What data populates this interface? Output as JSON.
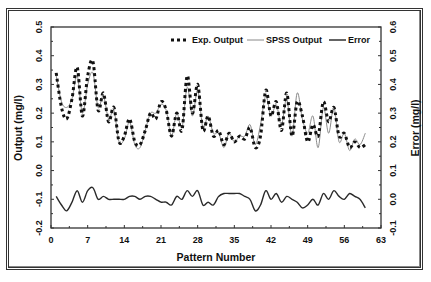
{
  "chart_data": {
    "type": "line",
    "title": "",
    "xlabel": "Pattern Number",
    "ylabel": "Output (mg/l)",
    "y2label": "Error (mg/l)",
    "xlim": [
      0,
      63
    ],
    "ylim": [
      -0.2,
      0.5
    ],
    "y2lim": [
      -0.1,
      0.6
    ],
    "x_ticks": [
      "0",
      "7",
      "14",
      "21",
      "28",
      "35",
      "42",
      "49",
      "56",
      "63"
    ],
    "y_ticks": [
      "-0.2",
      "-0.1",
      "0.0",
      "0.1",
      "0.2",
      "0.3",
      "0.4",
      "0.5"
    ],
    "y2_ticks": [
      "-0.1",
      "0.0",
      "0.1",
      "0.2",
      "0.3",
      "0.4",
      "0.5",
      "0.6"
    ],
    "grid": false,
    "legend_position": "top-right inside",
    "x": [
      1,
      2,
      3,
      4,
      5,
      6,
      7,
      8,
      9,
      10,
      11,
      12,
      13,
      14,
      15,
      16,
      17,
      18,
      19,
      20,
      21,
      22,
      23,
      24,
      25,
      26,
      27,
      28,
      29,
      30,
      31,
      32,
      33,
      34,
      35,
      36,
      37,
      38,
      39,
      40,
      41,
      42,
      43,
      44,
      45,
      46,
      47,
      48,
      49,
      50,
      51,
      52,
      53,
      54,
      55,
      56,
      57,
      58,
      59,
      60
    ],
    "series": [
      {
        "name": "Exp. Output",
        "style": "dashed-thick",
        "axis": "left",
        "values": [
          0.34,
          0.22,
          0.18,
          0.25,
          0.36,
          0.19,
          0.33,
          0.38,
          0.21,
          0.27,
          0.17,
          0.22,
          0.1,
          0.12,
          0.18,
          0.1,
          0.09,
          0.14,
          0.2,
          0.18,
          0.24,
          0.21,
          0.12,
          0.2,
          0.14,
          0.33,
          0.2,
          0.3,
          0.14,
          0.19,
          0.12,
          0.14,
          0.09,
          0.13,
          0.1,
          0.12,
          0.11,
          0.15,
          0.08,
          0.12,
          0.28,
          0.19,
          0.24,
          0.14,
          0.27,
          0.12,
          0.24,
          0.19,
          0.1,
          0.16,
          0.12,
          0.24,
          0.17,
          0.22,
          0.12,
          0.13,
          0.08,
          0.1,
          0.08,
          0.09
        ]
      },
      {
        "name": "SPSS Output",
        "style": "thin-gray",
        "axis": "left",
        "values": [
          0.33,
          0.24,
          0.22,
          0.25,
          0.33,
          0.2,
          0.3,
          0.34,
          0.22,
          0.26,
          0.18,
          0.21,
          0.1,
          0.11,
          0.17,
          0.09,
          0.08,
          0.14,
          0.2,
          0.2,
          0.23,
          0.21,
          0.12,
          0.2,
          0.15,
          0.29,
          0.19,
          0.28,
          0.15,
          0.19,
          0.13,
          0.13,
          0.08,
          0.13,
          0.1,
          0.12,
          0.12,
          0.16,
          0.09,
          0.16,
          0.26,
          0.19,
          0.23,
          0.16,
          0.25,
          0.12,
          0.27,
          0.18,
          0.13,
          0.19,
          0.08,
          0.22,
          0.13,
          0.22,
          0.1,
          0.13,
          0.07,
          0.11,
          0.09,
          0.13
        ]
      },
      {
        "name": "Error",
        "style": "solid-dark",
        "axis": "right",
        "values": [
          0.01,
          -0.02,
          -0.04,
          -0.01,
          0.03,
          -0.01,
          0.03,
          0.04,
          0.0,
          0.01,
          0.0,
          0.0,
          0.0,
          0.0,
          0.01,
          0.01,
          0.0,
          0.01,
          0.01,
          0.0,
          -0.01,
          -0.01,
          -0.02,
          0.01,
          0.0,
          0.03,
          0.01,
          0.03,
          -0.02,
          -0.01,
          -0.02,
          0.01,
          0.02,
          0.02,
          0.02,
          0.02,
          0.01,
          0.0,
          -0.04,
          -0.02,
          0.03,
          0.0,
          0.02,
          -0.01,
          0.01,
          0.0,
          -0.01,
          -0.03,
          -0.02,
          0.0,
          -0.02,
          0.02,
          0.0,
          0.03,
          0.01,
          0.0,
          0.02,
          0.01,
          0.0,
          -0.03
        ]
      }
    ]
  },
  "legend": {
    "items": [
      {
        "label": "Exp. Output"
      },
      {
        "label": "SPSS Output"
      },
      {
        "label": "Error"
      }
    ]
  },
  "axes": {
    "x_title": "Pattern Number",
    "y_title": "Output (mg/l)",
    "y2_title": "Error (mg/l)"
  }
}
